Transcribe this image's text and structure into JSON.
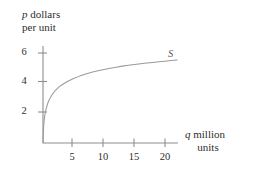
{
  "figure": {
    "background_color": "#ffffff",
    "line_color": "#8e8e8e",
    "curve_color": "#9a9a9a",
    "text_color": "#2e2e2e",
    "curve_label": "S",
    "y_axis_label_line1_var": "p",
    "y_axis_label_line1_rest": " dollars",
    "y_axis_label_line2": "per unit",
    "x_axis_label_line1_var": "q",
    "x_axis_label_line1_rest": " million",
    "x_axis_label_line2": "units",
    "y_ticks": [
      {
        "value": 2,
        "label": "2"
      },
      {
        "value": 4,
        "label": "4"
      },
      {
        "value": 6,
        "label": "6"
      }
    ],
    "x_ticks": [
      {
        "value": 5,
        "label": "5"
      },
      {
        "value": 10,
        "label": "10"
      },
      {
        "value": 15,
        "label": "15"
      },
      {
        "value": 20,
        "label": "20"
      }
    ]
  },
  "chart_data": {
    "type": "line",
    "title": "",
    "subtitle": "",
    "xlabel": "q million units",
    "ylabel": "p dollars per unit",
    "xlim": [
      0,
      22.6
    ],
    "ylim": [
      0,
      6.8
    ],
    "grid": false,
    "legend_position": "inline-right",
    "x_ticks": [
      5,
      10,
      15,
      20
    ],
    "y_ticks": [
      2,
      4,
      6
    ],
    "series": [
      {
        "name": "S",
        "label_text": "S",
        "description": "Supply curve, concave increasing (logarithmic shape), passing through origin",
        "x": [
          0.0,
          0.1,
          0.2,
          0.35,
          0.5,
          0.75,
          1.0,
          1.5,
          2.0,
          2.5,
          3.0,
          4.0,
          5.0,
          6.0,
          7.0,
          8.0,
          9.0,
          10.0,
          11.0,
          12.0,
          13.0,
          14.0,
          15.0,
          16.0,
          17.0,
          18.0,
          19.0,
          20.0,
          21.0,
          22.0
        ],
        "y": [
          0.0,
          1.05,
          1.52,
          1.93,
          2.2,
          2.55,
          2.8,
          3.15,
          3.4,
          3.6,
          3.76,
          4.0,
          4.2,
          4.35,
          4.48,
          4.6,
          4.7,
          4.78,
          4.86,
          4.93,
          5.0,
          5.06,
          5.11,
          5.16,
          5.2,
          5.24,
          5.28,
          5.32,
          5.36,
          5.4
        ]
      }
    ],
    "annotations": [
      {
        "text": "S",
        "x": 19.2,
        "y": 5.95
      }
    ]
  }
}
